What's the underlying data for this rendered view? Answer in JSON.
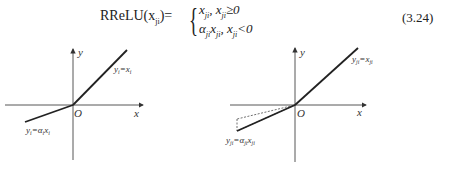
{
  "equation": {
    "lhs": "RReLU(x",
    "lhs_sub": "ji",
    "lhs_close": ")=",
    "case1_value": "x",
    "case1_value_sub": "ji",
    "case1_cond": ", x",
    "case1_cond_sub": "ji",
    "case1_rel": "≥0",
    "case2_value": "α",
    "case2_value_sub": "ji",
    "case2_value2": "x",
    "case2_value2_sub": "ji",
    "case2_cond": ", x",
    "case2_cond_sub": "ji",
    "case2_rel": "<0",
    "number": "(3.24)"
  },
  "figures": [
    {
      "x_axis_label": "x",
      "y_axis_label": "y",
      "origin_label": "O",
      "positive_branch_label": "y_i=x_i",
      "negative_branch_label": "y_i=α_i x_i"
    },
    {
      "x_axis_label": "x",
      "y_axis_label": "y",
      "origin_label": "O",
      "positive_branch_label": "y_ji=x_ji",
      "negative_branch_label": "y_ji=α_ji x_ji"
    }
  ]
}
